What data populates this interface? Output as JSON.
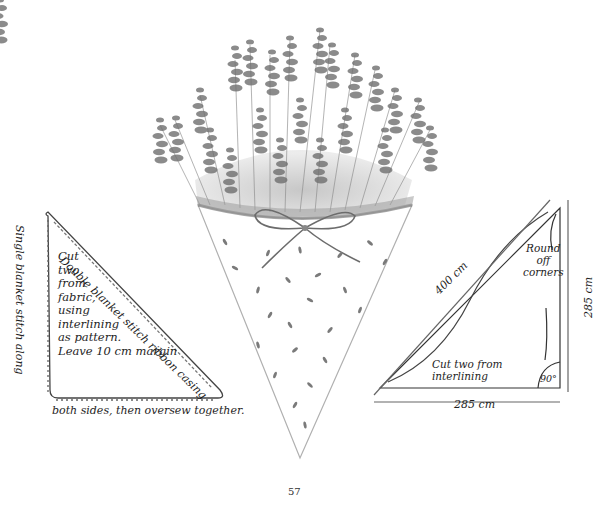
{
  "page_number": "57",
  "illustration": {
    "subject": "lavender-bouquet-in-paper-cone",
    "bow": "ribbon-bow"
  },
  "left_diagram": {
    "top_label": "Double blanket stitch ribbon casing",
    "side_label": "Single blanket stitch along",
    "bottom_label": "both sides, then oversew together.",
    "instructions": [
      "Cut",
      "two",
      "from",
      "fabric,",
      "using",
      "interlining",
      "as pattern.",
      "Leave 10 cm margin"
    ]
  },
  "right_diagram": {
    "hypotenuse_label": "400 cm",
    "vertical_label": "285 cm",
    "horizontal_label": "285 cm",
    "note_round": [
      "Round",
      "off",
      "corners"
    ],
    "note_cut": [
      "Cut two from",
      "interlining"
    ],
    "angle_label": "90°"
  }
}
